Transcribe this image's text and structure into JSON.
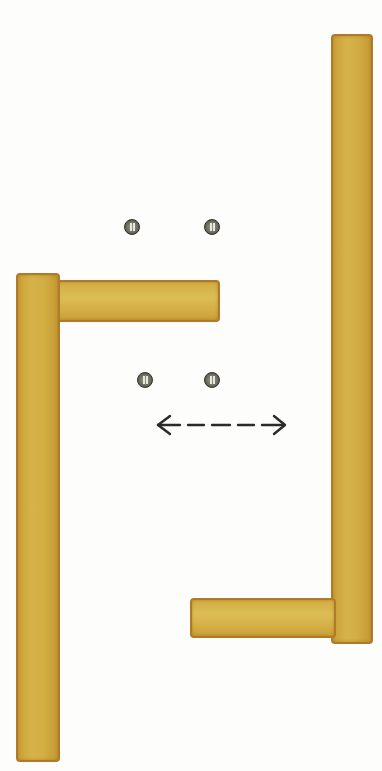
{
  "diagram": {
    "colors": {
      "wood": "#d2ad42",
      "wood_edge": "#b07a2a",
      "screw": "#6e6e62",
      "arrow": "#2a2a2a",
      "background": "#fdfdfb"
    },
    "elements": {
      "left_bracket": {
        "vertical_plank": "left-vertical-plank",
        "horizontal_plank": "left-horizontal-plank"
      },
      "right_bracket": {
        "vertical_plank": "right-vertical-plank",
        "horizontal_plank": "right-horizontal-plank"
      },
      "screws": 4,
      "arrow": "double-headed dashed arrow"
    }
  }
}
